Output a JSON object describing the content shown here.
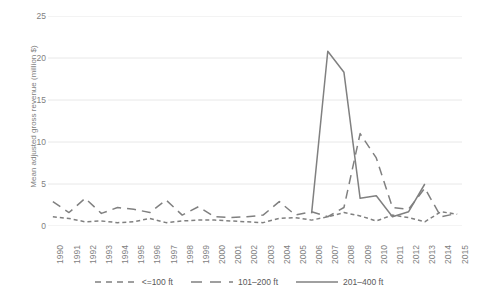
{
  "chart_data": {
    "type": "line",
    "title": "",
    "xlabel": "",
    "ylabel": "Mean adjusted gross revenue (million $)",
    "ylim": [
      0,
      25
    ],
    "yticks": [
      0,
      5,
      10,
      15,
      20,
      25
    ],
    "grid": "horizontal",
    "legend_position": "bottom",
    "x": [
      1990,
      1991,
      1992,
      1993,
      1994,
      1995,
      1996,
      1997,
      1998,
      1999,
      2000,
      2001,
      2002,
      2003,
      2004,
      2005,
      2006,
      2007,
      2008,
      2009,
      2010,
      2011,
      2012,
      2013,
      2014,
      2015
    ],
    "categories": [
      "1990",
      "1991",
      "1992",
      "1993",
      "1994",
      "1995",
      "1996",
      "1997",
      "1998",
      "1999",
      "2000",
      "2001",
      "2002",
      "2003",
      "2004",
      "2005",
      "2006",
      "2007",
      "2008",
      "2009",
      "2010",
      "2011",
      "2012",
      "2013",
      "2014",
      "2015"
    ],
    "series": [
      {
        "name": "<=100 ft",
        "style": "short-dash",
        "color": "#808080",
        "values": [
          1.1,
          0.9,
          0.5,
          0.6,
          0.4,
          0.5,
          0.9,
          0.4,
          0.6,
          0.7,
          0.7,
          0.6,
          0.5,
          0.4,
          0.9,
          1.0,
          0.7,
          1.1,
          1.6,
          1.2,
          0.6,
          1.3,
          1.0,
          0.5,
          1.7,
          1.4
        ]
      },
      {
        "name": "101–200 ft",
        "style": "long-dash",
        "color": "#808080",
        "values": [
          2.9,
          1.6,
          3.3,
          1.5,
          2.2,
          2.0,
          1.6,
          3.1,
          1.3,
          2.3,
          1.1,
          1.0,
          1.1,
          1.3,
          2.9,
          1.3,
          1.7,
          1.1,
          2.2,
          11.0,
          8.1,
          2.2,
          2.0,
          4.5,
          1.1,
          1.5
        ]
      },
      {
        "name": "201–400 ft",
        "style": "solid",
        "color": "#808080",
        "values": [
          null,
          null,
          null,
          null,
          null,
          null,
          null,
          null,
          null,
          null,
          null,
          null,
          null,
          null,
          null,
          null,
          1.5,
          20.8,
          18.3,
          3.3,
          3.6,
          1.1,
          1.7,
          5.0,
          null,
          null
        ]
      }
    ]
  },
  "axis": {
    "y_title": "Mean adjusted gross revenue (million $)",
    "y_tick_labels": [
      "25",
      "20",
      "15",
      "10",
      "5",
      "0"
    ],
    "x_tick_labels": [
      "1990",
      "1991",
      "1992",
      "1993",
      "1994",
      "1995",
      "1996",
      "1997",
      "1998",
      "1999",
      "2000",
      "2001",
      "2002",
      "2003",
      "2004",
      "2005",
      "2006",
      "2007",
      "2008",
      "2009",
      "2010",
      "2011",
      "2012",
      "2013",
      "2014",
      "2015"
    ]
  },
  "legend": {
    "items": [
      {
        "label": "<=100 ft",
        "style": "short-dash"
      },
      {
        "label": "101–200 ft",
        "style": "long-dash"
      },
      {
        "label": "201–400 ft",
        "style": "solid"
      }
    ]
  },
  "colors": {
    "line": "#808080",
    "grid": "#e8e8e8",
    "tick_text": "#7f7f7f",
    "legend_text": "#595959",
    "background": "#ffffff"
  }
}
